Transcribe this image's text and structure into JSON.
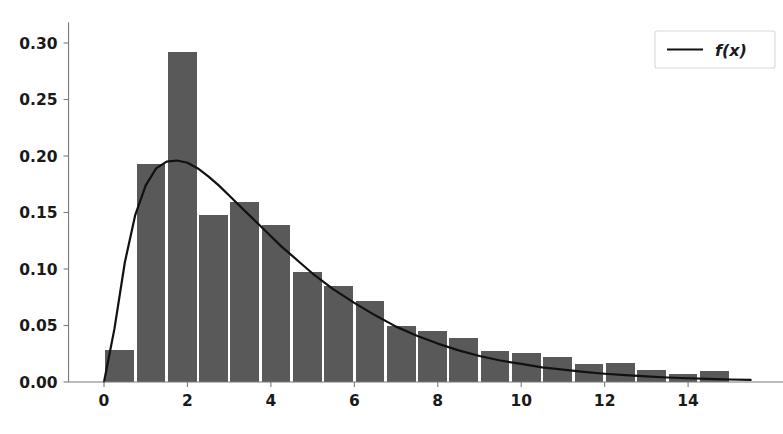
{
  "chart_data": {
    "type": "bar",
    "title": "",
    "subtitle": "",
    "xlabel": "",
    "ylabel": "",
    "xlim": [
      -0.85,
      16.3
    ],
    "ylim": [
      -0.006,
      0.313
    ],
    "grid": false,
    "legend_position": "upper right",
    "bar_color": "#595959",
    "line_color": "#111111",
    "background_color": "#ffffff",
    "axis_color": "#7a7a7a",
    "xticks": [
      0,
      2,
      4,
      6,
      8,
      10,
      12,
      14
    ],
    "xtick_labels": [
      "0",
      "2",
      "4",
      "6",
      "8",
      "10",
      "12",
      "14"
    ],
    "yticks": [
      0.0,
      0.05,
      0.1,
      0.15,
      0.2,
      0.25,
      0.3
    ],
    "ytick_labels": [
      "0.00",
      "0.05",
      "0.10",
      "0.15",
      "0.20",
      "0.25",
      "0.30"
    ],
    "bin_width": 0.75,
    "bin_edges": [
      0.0,
      0.75,
      1.5,
      2.25,
      3.0,
      3.75,
      4.5,
      5.25,
      6.0,
      6.75,
      7.5,
      8.25,
      9.0,
      9.75,
      10.5,
      11.25,
      12.0,
      12.75,
      13.5,
      14.25,
      15.0
    ],
    "categories": [
      "0.00-0.75",
      "0.75-1.50",
      "1.50-2.25",
      "2.25-3.00",
      "3.00-3.75",
      "3.75-4.50",
      "4.50-5.25",
      "5.25-6.00",
      "6.00-6.75",
      "6.75-7.50",
      "7.50-8.25",
      "8.25-9.00",
      "9.00-9.75",
      "9.75-10.50",
      "10.50-11.25",
      "11.25-12.00",
      "12.00-12.75",
      "12.75-13.50",
      "13.50-14.25",
      "14.25-15.00"
    ],
    "values": [
      0.028,
      0.193,
      0.292,
      0.148,
      0.159,
      0.139,
      0.097,
      0.085,
      0.072,
      0.05,
      0.045,
      0.039,
      0.027,
      0.026,
      0.022,
      0.016,
      0.017,
      0.011,
      0.007,
      0.01
    ],
    "series": [
      {
        "name": "histogram",
        "kind": "bar",
        "values": [
          0.028,
          0.193,
          0.292,
          0.148,
          0.159,
          0.139,
          0.097,
          0.085,
          0.072,
          0.05,
          0.045,
          0.039,
          0.027,
          0.026,
          0.022,
          0.016,
          0.017,
          0.011,
          0.007,
          0.01
        ]
      },
      {
        "name": "f(x)",
        "kind": "line",
        "x": [
          0.0,
          0.25,
          0.5,
          0.75,
          1.0,
          1.25,
          1.5,
          1.75,
          2.0,
          2.25,
          2.5,
          2.75,
          3.0,
          3.25,
          3.5,
          3.75,
          4.0,
          4.25,
          4.5,
          4.75,
          5.0,
          5.5,
          6.0,
          6.5,
          7.0,
          7.5,
          8.0,
          8.5,
          9.0,
          9.5,
          10.0,
          10.5,
          11.0,
          11.5,
          12.0,
          12.5,
          13.0,
          13.5,
          14.0,
          14.5,
          15.0,
          15.5
        ],
        "y": [
          0.0,
          0.047,
          0.106,
          0.148,
          0.174,
          0.189,
          0.195,
          0.196,
          0.194,
          0.189,
          0.182,
          0.174,
          0.165,
          0.156,
          0.147,
          0.138,
          0.129,
          0.12,
          0.112,
          0.104,
          0.096,
          0.082,
          0.07,
          0.059,
          0.049,
          0.041,
          0.034,
          0.028,
          0.023,
          0.019,
          0.016,
          0.013,
          0.011,
          0.009,
          0.0073,
          0.006,
          0.0049,
          0.004,
          0.0033,
          0.0027,
          0.0022,
          0.0018
        ]
      }
    ],
    "legend": [
      {
        "label": "f(x)",
        "marker": "line",
        "color": "#111111"
      }
    ],
    "peak": {
      "x": 1.85,
      "y": 0.196
    },
    "max_bar": {
      "bin": "1.50-2.25",
      "value": 0.292
    }
  }
}
